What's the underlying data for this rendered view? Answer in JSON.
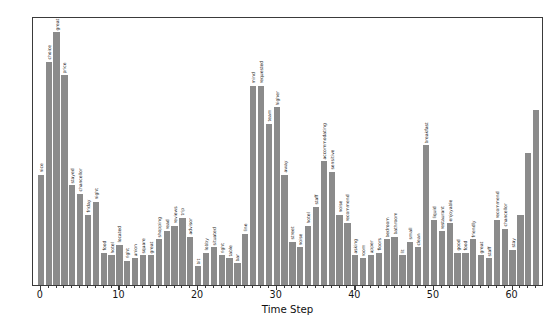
{
  "chart_data": {
    "type": "bar",
    "title": "",
    "subtitle": "",
    "xlabel": "Time Step",
    "ylabel": "",
    "grid": false,
    "legend": null,
    "xlim": [
      -1,
      64
    ],
    "ylim": [
      0,
      1.0
    ],
    "x_ticks": [
      0,
      10,
      20,
      30,
      40,
      50,
      60
    ],
    "x_tick_labels": [
      "0",
      "10",
      "20",
      "30",
      "40",
      "50",
      "60"
    ],
    "y_ticks": [],
    "y_tick_labels": [],
    "bar_color": "#8b8b8b",
    "x": [
      0,
      1,
      2,
      3,
      4,
      5,
      6,
      7,
      8,
      9,
      10,
      11,
      12,
      13,
      14,
      15,
      16,
      17,
      18,
      19,
      20,
      21,
      22,
      23,
      24,
      25,
      26,
      27,
      28,
      29,
      30,
      31,
      32,
      33,
      34,
      35,
      36,
      37,
      38,
      39,
      40,
      41,
      42,
      43,
      44,
      45,
      46,
      47,
      48,
      49,
      50,
      51,
      52,
      53,
      54,
      55,
      56,
      57,
      58,
      59,
      60,
      61,
      62,
      63
    ],
    "values": [
      0.41,
      0.83,
      0.94,
      0.78,
      0.37,
      0.34,
      0.26,
      0.31,
      0.12,
      0.11,
      0.15,
      0.09,
      0.1,
      0.11,
      0.11,
      0.17,
      0.2,
      0.22,
      0.25,
      0.18,
      0.07,
      0.12,
      0.14,
      0.11,
      0.1,
      0.08,
      0.19,
      0.74,
      0.74,
      0.6,
      0.66,
      0.41,
      0.16,
      0.14,
      0.22,
      0.29,
      0.46,
      0.42,
      0.26,
      0.23,
      0.11,
      0.1,
      0.11,
      0.12,
      0.17,
      0.18,
      0.11,
      0.16,
      0.14,
      0.52,
      0.24,
      0.2,
      0.23,
      0.12,
      0.12,
      0.17,
      0.11,
      0.1,
      0.24,
      0.21,
      0.13,
      0.26,
      0.49,
      0.65
    ],
    "point_labels": [
      "nice",
      "choice",
      "great",
      "price",
      "stayed",
      "chancellor",
      "friday",
      "night",
      "food",
      "hotel",
      "located",
      "right",
      "union",
      "square",
      "great",
      "shopping",
      "read",
      "reviews",
      "trip",
      "advisor",
      "bit",
      "lobby",
      "situated",
      "right",
      "table",
      "bar",
      "line",
      "mind",
      "requested",
      "team",
      "higher",
      "away",
      "street",
      "noise",
      "hotel",
      "staff",
      "accommodating",
      "sensitive",
      "noise",
      "recommend",
      "asking",
      "room",
      "upper",
      "floors",
      "bedroom",
      "bathroom",
      "lit",
      "small",
      "clean",
      "breakfast",
      "liquid",
      "restaurant",
      "enjoyable",
      "good",
      "food",
      "friendly",
      "great",
      "staff",
      "recommend",
      "chancellor",
      "stay",
      "",
      "",
      ""
    ]
  }
}
